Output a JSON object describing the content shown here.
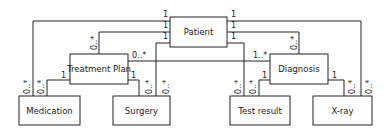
{
  "diagram": {
    "type": "uml-class-diagram",
    "classes": {
      "patient": "Patient",
      "treatment_plan": "Treatment Plan",
      "diagnosis": "Diagnosis",
      "medication": "Medication",
      "surgery": "Surgery",
      "test_result": "Test result",
      "xray": "X-ray"
    },
    "associations": [
      {
        "from": "Patient",
        "to": "Medication",
        "from_mult": "1",
        "to_mult": "0..*"
      },
      {
        "from": "Patient",
        "to": "Treatment Plan",
        "from_mult": "1",
        "to_mult": "0..*"
      },
      {
        "from": "Patient",
        "to": "Surgery",
        "from_mult": "1",
        "to_mult": "0..*"
      },
      {
        "from": "Patient",
        "to": "X-ray",
        "from_mult": "1",
        "to_mult": "0..*"
      },
      {
        "from": "Patient",
        "to": "Diagnosis",
        "from_mult": "1",
        "to_mult": "0..*"
      },
      {
        "from": "Patient",
        "to": "Test result",
        "from_mult": "1",
        "to_mult": "0..*"
      },
      {
        "from": "Treatment Plan",
        "to": "Diagnosis",
        "from_mult": "0..*",
        "to_mult": "1..*"
      },
      {
        "from": "Treatment Plan",
        "to": "Medication",
        "from_mult": "1",
        "to_mult": "0..*"
      },
      {
        "from": "Treatment Plan",
        "to": "Surgery",
        "from_mult": "1",
        "to_mult": "0..*"
      },
      {
        "from": "Diagnosis",
        "to": "Test result",
        "from_mult": "1",
        "to_mult": "0..*"
      },
      {
        "from": "Diagnosis",
        "to": "X-ray",
        "from_mult": "1",
        "to_mult": "0..*"
      }
    ],
    "multiplicity": {
      "one": "1",
      "zero_many": "0..*",
      "one_many": "1..*"
    }
  }
}
